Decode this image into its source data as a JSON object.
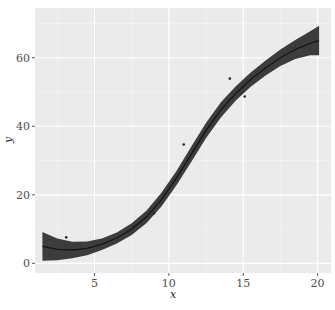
{
  "chart_data": {
    "type": "scatter",
    "title": "",
    "xlabel": "x",
    "ylabel": "y",
    "xlim": [
      1.0,
      20.9
    ],
    "ylim": [
      -2.8,
      74.5
    ],
    "grid": true,
    "legend": null,
    "x_ticks": [
      5,
      10,
      15,
      20
    ],
    "y_ticks": [
      0,
      20,
      40,
      60
    ],
    "x_minor": [
      2.5,
      7.5,
      12.5,
      17.5
    ],
    "y_minor": [
      10,
      30,
      50,
      70
    ],
    "colors": {
      "panel_bg": "#ebebeb",
      "grid_major": "#ffffff",
      "ribbon": "#3c3c3c",
      "smooth_line": "#151515",
      "points": "#262626"
    },
    "points": [
      {
        "x": 3.1,
        "y": 7.6
      },
      {
        "x": 9.0,
        "y": 14.6
      },
      {
        "x": 11.0,
        "y": 34.7
      },
      {
        "x": 14.1,
        "y": 53.9
      },
      {
        "x": 15.1,
        "y": 48.7
      }
    ],
    "smooth": {
      "x": [
        1.5,
        2.5,
        3.5,
        4.5,
        5.5,
        6.5,
        7.5,
        8.5,
        9.5,
        10.5,
        11.5,
        12.5,
        13.5,
        14.5,
        15.5,
        16.5,
        17.5,
        18.5,
        19.5,
        20.1
      ],
      "y": [
        5.0,
        4.1,
        3.9,
        4.4,
        5.6,
        7.4,
        10.0,
        13.6,
        18.6,
        24.8,
        31.8,
        38.8,
        44.8,
        49.6,
        53.6,
        57.0,
        60.0,
        62.4,
        64.2,
        65.0
      ],
      "upper": [
        9.2,
        7.3,
        6.3,
        6.4,
        7.3,
        9.0,
        11.7,
        15.4,
        20.6,
        26.9,
        34.0,
        41.0,
        47.0,
        51.7,
        55.7,
        59.2,
        62.4,
        65.2,
        67.7,
        69.3
      ],
      "lower": [
        0.8,
        0.9,
        1.5,
        2.4,
        3.9,
        5.8,
        8.3,
        11.8,
        16.6,
        22.7,
        29.6,
        36.6,
        42.6,
        47.5,
        51.5,
        54.8,
        57.6,
        59.6,
        60.7,
        60.7
      ]
    }
  }
}
